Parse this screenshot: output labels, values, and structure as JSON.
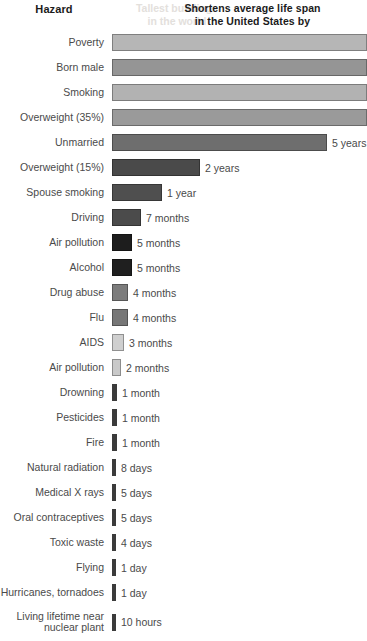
{
  "header": {
    "left_title": "Hazard",
    "right_title_line1": "Shortens average life span",
    "right_title_line2": "in the United States by",
    "ghost_line1": "Tallest buildings",
    "ghost_line2": "in the world"
  },
  "chart_data": {
    "type": "bar",
    "xlabel": "Shortens average life span in the United States by",
    "ylabel": "Hazard",
    "orientation": "horizontal",
    "grid": false,
    "legend": false,
    "categories": [
      "Poverty",
      "Born male",
      "Smoking",
      "Overweight (35%)",
      "Unmarried",
      "Overweight (15%)",
      "Spouse smoking",
      "Driving",
      "Air pollution",
      "Alcohol",
      "Drug abuse",
      "Flu",
      "AIDS",
      "Air pollution",
      "Drowning",
      "Pesticides",
      "Fire",
      "Natural radiation",
      "Medical X rays",
      "Oral contraceptives",
      "Toxic waste",
      "Flying",
      "Hurricanes, tornadoes",
      "Living lifetime near\nnuclear plant"
    ],
    "value_labels": [
      "",
      "",
      "",
      "",
      "5 years",
      "2 years",
      "1 year",
      "7 months",
      "5 months",
      "5 months",
      "4 months",
      "4 months",
      "3 months",
      "2 months",
      "1 month",
      "1 month",
      "1 month",
      "8 days",
      "5 days",
      "5 days",
      "4 days",
      "1 day",
      "1 day",
      "10 hours"
    ],
    "values_days": [
      3285,
      2920,
      2555,
      2190,
      1825,
      730,
      365,
      213,
      152,
      152,
      122,
      122,
      91,
      61,
      30,
      30,
      30,
      8,
      5,
      5,
      4,
      1,
      1,
      0.42
    ],
    "units": "days of life expectancy lost",
    "bar_widths_px": [
      255,
      255,
      255,
      255,
      215,
      88,
      50,
      29,
      20,
      20,
      16,
      16,
      12,
      9,
      5,
      5,
      5,
      4,
      4,
      4,
      4,
      4,
      4,
      4
    ],
    "bar_colors": [
      "#b6b6b6",
      "#959595",
      "#b2b2b2",
      "#9a9a9a",
      "#6e6e6e",
      "#4a4a4a",
      "#4f4f4f",
      "#4b4b4b",
      "#1d1d1d",
      "#1f1f1f",
      "#7c7c7c",
      "#777777",
      "#cfcfcf",
      "#c9c9c9",
      "#3b3b3b",
      "#3b3b3b",
      "#3b3b3b",
      "#3b3b3b",
      "#3b3b3b",
      "#3b3b3b",
      "#3b3b3b",
      "#3b3b3b",
      "#3b3b3b",
      "#3b3b3b"
    ]
  }
}
